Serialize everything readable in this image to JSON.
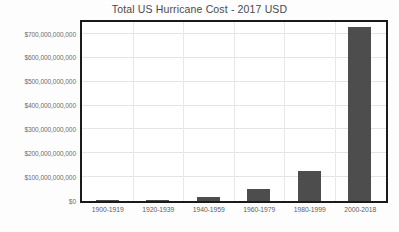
{
  "chart_data": {
    "type": "bar",
    "title": "Total US Hurricane Cost - 2017 USD",
    "xlabel": "",
    "ylabel": "",
    "categories": [
      "1900-1919",
      "1920-1939",
      "1940-1959",
      "1960-1979",
      "1980-1999",
      "2000-2018"
    ],
    "values": [
      1000000000,
      5000000000,
      15000000000,
      50000000000,
      125000000000,
      730000000000
    ],
    "ylim": [
      0,
      730000000000
    ],
    "y_ticks": [
      0,
      100000000000,
      200000000000,
      300000000000,
      400000000000,
      500000000000,
      600000000000,
      700000000000
    ],
    "y_tick_labels": [
      "$0",
      "$100,000,000,000",
      "$200,000,000,000",
      "$300,000,000,000",
      "$400,000,000,000",
      "$500,000,000,000",
      "$600,000,000,000",
      "$700,000,000,000"
    ],
    "y_axis_max_gridline": 700000000000,
    "grid": true,
    "grid_horizontal": true,
    "grid_vertical": true,
    "legend": false,
    "legend_position": "none",
    "bar_color": "#4d4d4d",
    "plot_border_color": "#1a1a1a",
    "grid_color": "#e4e4e4",
    "title_color": "#4a4a4a",
    "tick_label_color": "#6e6e6e",
    "background_color": "#ffffff"
  }
}
